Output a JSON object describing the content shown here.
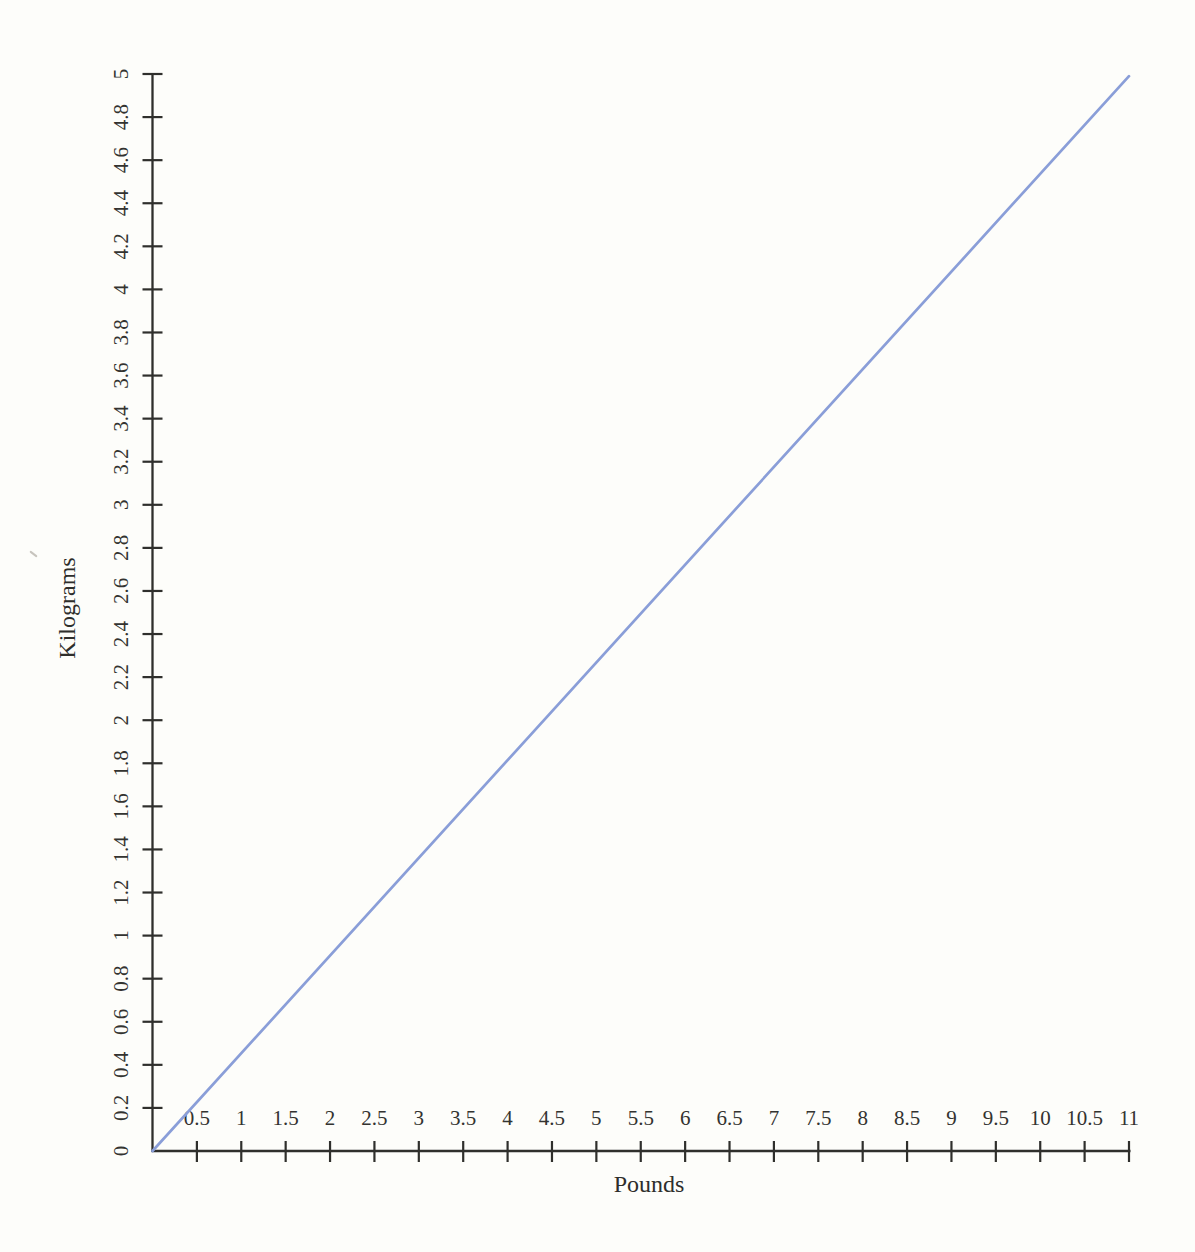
{
  "page": {
    "background": "#fdfdfa"
  },
  "chart_data": {
    "type": "line",
    "title": "",
    "xlabel": "Pounds",
    "ylabel": "Kilograms",
    "x_range": [
      0,
      11
    ],
    "y_range": [
      0,
      5
    ],
    "x_tick_step": 0.5,
    "y_tick_step": 0.2,
    "x_tick_labels": [
      "0.5",
      "1",
      "1.5",
      "2",
      "2.5",
      "3",
      "3.5",
      "4",
      "4.5",
      "5",
      "5.5",
      "6",
      "6.5",
      "7",
      "7.5",
      "8",
      "8.5",
      "9",
      "9.5",
      "10",
      "10.5",
      "11"
    ],
    "y_tick_labels": [
      "0",
      "0.2",
      "0.4",
      "0.6",
      "0.8",
      "1",
      "1.2",
      "1.4",
      "1.6",
      "1.8",
      "2",
      "2.2",
      "2.4",
      "2.6",
      "2.8",
      "3",
      "3.2",
      "3.4",
      "3.6",
      "3.8",
      "4",
      "4.2",
      "4.4",
      "4.6",
      "4.8",
      "5"
    ],
    "grid": false,
    "legend_position": "none",
    "axis_color": "#2f2f2c",
    "label_color": "#333330",
    "series": [
      {
        "name": "kilograms vs pounds",
        "color": "#8a9ed8",
        "points": [
          [
            0,
            0
          ],
          [
            11,
            4.99
          ]
        ]
      }
    ]
  }
}
